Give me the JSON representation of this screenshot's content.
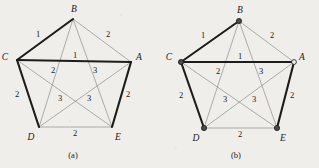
{
  "figure": {
    "background_color": "#efeeea",
    "bold_edge_color": "#1c1c1c",
    "thin_edge_color": "#8c8c8c",
    "node_fill_color": "#4a4a4a",
    "panels": [
      {
        "id": "panel-a",
        "caption": "(a)",
        "caption_x": 73,
        "caption_y": 158,
        "origin_x": 0,
        "vertices": [
          {
            "id": "A",
            "label": "A",
            "x": 131,
            "y": 62,
            "marker": "none",
            "label_x": 139,
            "label_y": 60
          },
          {
            "id": "B",
            "label": "B",
            "x": 73,
            "y": 19,
            "marker": "none",
            "label_x": 74,
            "label_y": 12
          },
          {
            "id": "C",
            "label": "C",
            "x": 17,
            "y": 60,
            "marker": "none",
            "label_x": 5,
            "label_y": 60
          },
          {
            "id": "D",
            "label": "D",
            "x": 39,
            "y": 127,
            "marker": "none",
            "label_x": 31,
            "label_y": 140
          },
          {
            "id": "E",
            "label": "E",
            "x": 112,
            "y": 127,
            "marker": "none",
            "label_x": 118,
            "label_y": 140
          }
        ],
        "edges": [
          {
            "from": "B",
            "to": "C",
            "weight": "1",
            "bold": true,
            "label_x": 38,
            "label_y": 37
          },
          {
            "from": "B",
            "to": "A",
            "weight": "2",
            "bold": false,
            "label_x": 108,
            "label_y": 37
          },
          {
            "from": "C",
            "to": "A",
            "weight": "1",
            "bold": true,
            "label_x": 75,
            "label_y": 58
          },
          {
            "from": "C",
            "to": "D",
            "weight": "2",
            "bold": true,
            "label_x": 17,
            "label_y": 97
          },
          {
            "from": "A",
            "to": "E",
            "weight": "2",
            "bold": true,
            "label_x": 128,
            "label_y": 97
          },
          {
            "from": "D",
            "to": "E",
            "weight": "2",
            "bold": false,
            "label_x": 75,
            "label_y": 136
          },
          {
            "from": "B",
            "to": "D",
            "weight": "2",
            "bold": false,
            "label_x": 53,
            "label_y": 73
          },
          {
            "from": "B",
            "to": "E",
            "weight": "3",
            "bold": false,
            "label_x": 95,
            "label_y": 73
          },
          {
            "from": "C",
            "to": "E",
            "weight": "3",
            "bold": false,
            "label_x": 60,
            "label_y": 101
          },
          {
            "from": "A",
            "to": "D",
            "weight": "3",
            "bold": false,
            "label_x": 89,
            "label_y": 101
          }
        ]
      },
      {
        "id": "panel-b",
        "caption": "(b)",
        "caption_x": 236,
        "caption_y": 158,
        "origin_x": 163,
        "vertices": [
          {
            "id": "A",
            "label": "A",
            "x": 294,
            "y": 62,
            "marker": "open",
            "label_x": 302,
            "label_y": 60
          },
          {
            "id": "B",
            "label": "B",
            "x": 239,
            "y": 21,
            "marker": "filled",
            "label_x": 240,
            "label_y": 13
          },
          {
            "id": "C",
            "label": "C",
            "x": 181,
            "y": 62,
            "marker": "filled",
            "label_x": 169,
            "label_y": 60
          },
          {
            "id": "D",
            "label": "D",
            "x": 204,
            "y": 128,
            "marker": "filled",
            "label_x": 196,
            "label_y": 141
          },
          {
            "id": "E",
            "label": "E",
            "x": 277,
            "y": 128,
            "marker": "filled",
            "label_x": 283,
            "label_y": 141
          }
        ],
        "edges": [
          {
            "from": "B",
            "to": "C",
            "weight": "1",
            "bold": true,
            "label_x": 203,
            "label_y": 38
          },
          {
            "from": "B",
            "to": "A",
            "weight": "2",
            "bold": false,
            "label_x": 272,
            "label_y": 38
          },
          {
            "from": "C",
            "to": "A",
            "weight": "1",
            "bold": true,
            "label_x": 240,
            "label_y": 59
          },
          {
            "from": "C",
            "to": "D",
            "weight": "2",
            "bold": true,
            "label_x": 181,
            "label_y": 98
          },
          {
            "from": "A",
            "to": "E",
            "weight": "2",
            "bold": true,
            "label_x": 292,
            "label_y": 98
          },
          {
            "from": "D",
            "to": "E",
            "weight": "2",
            "bold": false,
            "label_x": 240,
            "label_y": 137
          },
          {
            "from": "B",
            "to": "D",
            "weight": "2",
            "bold": false,
            "label_x": 218,
            "label_y": 74
          },
          {
            "from": "B",
            "to": "E",
            "weight": "3",
            "bold": false,
            "label_x": 261,
            "label_y": 74
          },
          {
            "from": "C",
            "to": "E",
            "weight": "3",
            "bold": false,
            "label_x": 225,
            "label_y": 102
          },
          {
            "from": "A",
            "to": "D",
            "weight": "3",
            "bold": false,
            "label_x": 254,
            "label_y": 102
          }
        ]
      }
    ]
  }
}
